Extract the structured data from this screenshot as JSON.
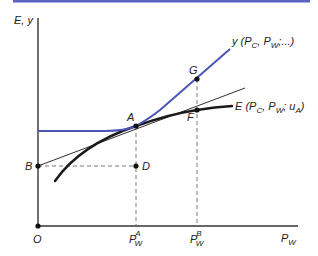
{
  "colors": {
    "top_rule": "#5b63c4",
    "y_curve": "#4a55b8",
    "e_curve": "#1a1a1a",
    "tangent": "#1a1a1a",
    "axis": "#333333",
    "guide": "#555555"
  },
  "axes": {
    "y_label": "E, y",
    "x_label_main": "P",
    "x_label_sub": "W",
    "origin_label": "O"
  },
  "curves": {
    "y_curve": {
      "label_main": "y (P",
      "label_sub1": "C",
      "label_mid": ", P",
      "label_sub2": "W",
      "label_end": ";...)"
    },
    "e_curve": {
      "label_main": "E (P",
      "label_sub1": "C",
      "label_mid": ", P",
      "label_sub2": "W",
      "label_semi": "; u",
      "label_sub3": "A",
      "label_end": ")"
    }
  },
  "points": {
    "A": "A",
    "B": "B",
    "D": "D",
    "F": "F",
    "G": "G"
  },
  "ticks": {
    "pwa": {
      "main": "P",
      "sub": "W",
      "sup": "A"
    },
    "pwb": {
      "main": "P",
      "sub": "W",
      "sup": "B"
    }
  }
}
